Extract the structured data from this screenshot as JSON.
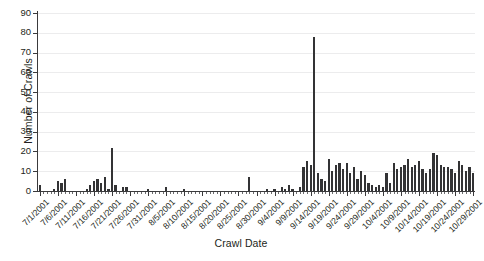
{
  "chart_data": {
    "type": "bar",
    "title": "",
    "xlabel": "Crawl Date",
    "ylabel": "Number of Crawls",
    "ylim": [
      0,
      90
    ],
    "ytick_values": [
      0,
      10,
      20,
      30,
      40,
      50,
      60,
      70,
      80,
      90
    ],
    "ytick_labels": [
      "0",
      "10",
      "20",
      "30",
      "40",
      "50",
      "60",
      "70",
      "80",
      "90"
    ],
    "grid": "horizontal",
    "legend": "none",
    "bar_color": "#333335",
    "axis_color": "#3a3a3c",
    "grid_color": "#ececed",
    "background": "#ffffff",
    "xtick_labels": [
      "7/1/2001",
      "7/6/2001",
      "7/11/2001",
      "7/16/2001",
      "7/21/2001",
      "7/26/2001",
      "7/31/2001",
      "8/5/2001",
      "8/10/2001",
      "8/15/2001",
      "8/20/2001",
      "8/25/2001",
      "8/30/2001",
      "9/4/2001",
      "9/9/2001",
      "9/14/2001",
      "9/19/2001",
      "9/24/2001",
      "9/29/2001",
      "10/4/2001",
      "10/9/2001",
      "10/14/2001",
      "10/19/2001",
      "10/24/2001",
      "10/29/2001"
    ],
    "xtick_indices": [
      0,
      5,
      10,
      15,
      20,
      25,
      30,
      35,
      40,
      45,
      50,
      55,
      60,
      65,
      70,
      75,
      80,
      85,
      90,
      95,
      100,
      105,
      110,
      115,
      120
    ],
    "categories": [
      "7/1/2001",
      "7/2/2001",
      "7/3/2001",
      "7/4/2001",
      "7/5/2001",
      "7/6/2001",
      "7/7/2001",
      "7/8/2001",
      "7/9/2001",
      "7/10/2001",
      "7/11/2001",
      "7/12/2001",
      "7/13/2001",
      "7/14/2001",
      "7/15/2001",
      "7/16/2001",
      "7/17/2001",
      "7/18/2001",
      "7/19/2001",
      "7/20/2001",
      "7/21/2001",
      "7/22/2001",
      "7/23/2001",
      "7/24/2001",
      "7/25/2001",
      "7/26/2001",
      "7/27/2001",
      "7/28/2001",
      "7/29/2001",
      "7/30/2001",
      "7/31/2001",
      "8/1/2001",
      "8/2/2001",
      "8/3/2001",
      "8/4/2001",
      "8/5/2001",
      "8/6/2001",
      "8/7/2001",
      "8/8/2001",
      "8/9/2001",
      "8/10/2001",
      "8/11/2001",
      "8/12/2001",
      "8/13/2001",
      "8/14/2001",
      "8/15/2001",
      "8/16/2001",
      "8/17/2001",
      "8/18/2001",
      "8/19/2001",
      "8/20/2001",
      "8/21/2001",
      "8/22/2001",
      "8/23/2001",
      "8/24/2001",
      "8/25/2001",
      "8/26/2001",
      "8/27/2001",
      "8/28/2001",
      "8/29/2001",
      "8/30/2001",
      "8/31/2001",
      "9/1/2001",
      "9/2/2001",
      "9/3/2001",
      "9/4/2001",
      "9/5/2001",
      "9/6/2001",
      "9/7/2001",
      "9/8/2001",
      "9/9/2001",
      "9/10/2001",
      "9/11/2001",
      "9/12/2001",
      "9/13/2001",
      "9/14/2001",
      "9/15/2001",
      "9/16/2001",
      "9/17/2001",
      "9/18/2001",
      "9/19/2001",
      "9/20/2001",
      "9/21/2001",
      "9/22/2001",
      "9/23/2001",
      "9/24/2001",
      "9/25/2001",
      "9/26/2001",
      "9/27/2001",
      "9/28/2001",
      "9/29/2001",
      "9/30/2001",
      "10/1/2001",
      "10/2/2001",
      "10/3/2001",
      "10/4/2001",
      "10/5/2001",
      "10/6/2001",
      "10/7/2001",
      "10/8/2001",
      "10/9/2001",
      "10/10/2001",
      "10/11/2001",
      "10/12/2001",
      "10/13/2001",
      "10/14/2001",
      "10/15/2001",
      "10/16/2001",
      "10/17/2001",
      "10/18/2001",
      "10/19/2001",
      "10/20/2001",
      "10/21/2001",
      "10/22/2001",
      "10/23/2001",
      "10/24/2001",
      "10/25/2001",
      "10/26/2001",
      "10/27/2001",
      "10/28/2001",
      "10/29/2001"
    ],
    "values": [
      3,
      0,
      0,
      0,
      1,
      5,
      4,
      6,
      0,
      0,
      0,
      0,
      0,
      1,
      3,
      5,
      6,
      4,
      7,
      1,
      22,
      3,
      0,
      2,
      2,
      0,
      0,
      0,
      0,
      0,
      1,
      0,
      0,
      0,
      0,
      2,
      0,
      0,
      0,
      0,
      1,
      0,
      0,
      0,
      0,
      0,
      0,
      0,
      0,
      0,
      0,
      0,
      0,
      0,
      0,
      0,
      0,
      0,
      7,
      0,
      0,
      0,
      0,
      1,
      0,
      1,
      0,
      2,
      1,
      3,
      1,
      0,
      2,
      12,
      15,
      13,
      78,
      9,
      6,
      5,
      16,
      10,
      13,
      14,
      11,
      14,
      9,
      12,
      6,
      10,
      8,
      4,
      3,
      2,
      3,
      2,
      9,
      4,
      14,
      11,
      12,
      13,
      16,
      12,
      13,
      15,
      11,
      9,
      11,
      19,
      18,
      13,
      12,
      12,
      11,
      9,
      15,
      13,
      10,
      12,
      9
    ]
  }
}
